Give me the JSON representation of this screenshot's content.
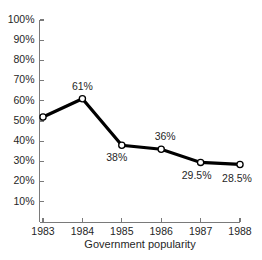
{
  "chart_data": {
    "type": "line",
    "title": "",
    "xlabel": "Government popularity",
    "ylabel": "",
    "categories": [
      "1983",
      "1984",
      "1985",
      "1986",
      "1987",
      "1988"
    ],
    "values": [
      52,
      61,
      38,
      36,
      29.5,
      28.5
    ],
    "point_labels": [
      "",
      "61%",
      "38%",
      "36%",
      "29.5%",
      "28.5%"
    ],
    "ylim": [
      0,
      100
    ],
    "y_ticks": [
      10,
      20,
      30,
      40,
      50,
      60,
      70,
      80,
      90,
      100
    ],
    "y_tick_labels": [
      "10%",
      "20%",
      "30%",
      "40%",
      "50%",
      "60%",
      "70%",
      "80%",
      "90%",
      "100%"
    ],
    "grid": false,
    "legend": "none",
    "marker": "open-circle",
    "line_color": "#000000",
    "marker_fill": "#ffffff",
    "axis_color": "#7a7a7a",
    "background": "#ffffff"
  }
}
